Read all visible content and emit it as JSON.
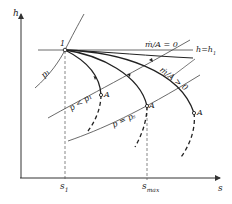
{
  "diagram": {
    "axes": {
      "y_label": "h",
      "x_label": "s",
      "x_ticks": [
        "s₁",
        "s_max"
      ],
      "x_tick_display": {
        "s1": "s",
        "s1_sub": "1",
        "smax": "s",
        "smax_sub": "max"
      }
    },
    "point_labels": {
      "state1": "1",
      "A1": "A",
      "A2": "A",
      "A3": "A"
    },
    "line_labels": {
      "isenthalpic": "h = h₁",
      "h_main": "h",
      "h_eq": "=",
      "h_rhs": "h",
      "h_rhs_sub": "1",
      "mdot_zero": "ṁ/A = 0",
      "mdot_gt_zero": "ṁ/A > 0",
      "p1": "p₁",
      "p_lt_p1": "p < p₁",
      "p_eq_ps": "p = pₛ"
    },
    "colors": {
      "line": "#333333",
      "background": "#ffffff"
    }
  }
}
